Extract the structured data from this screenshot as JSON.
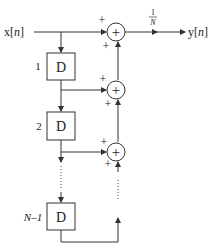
{
  "diagram": {
    "type": "block-diagram",
    "input": {
      "label": "x",
      "index": "n"
    },
    "output": {
      "label": "y",
      "index": "n"
    },
    "gain": {
      "numerator": "1",
      "denominator": "N"
    },
    "delays": [
      {
        "index_label": "1",
        "text": "D"
      },
      {
        "index_label": "2",
        "text": "D"
      },
      {
        "index_label": "N–1",
        "text": "D"
      }
    ],
    "adders": [
      {
        "symbol": "+",
        "sign_left": "+",
        "sign_bottom": "+"
      },
      {
        "symbol": "+",
        "sign_left": "+",
        "sign_bottom": "+"
      },
      {
        "symbol": "+",
        "sign_left": "+",
        "sign_bottom": "+"
      }
    ],
    "ellipsis": "⋮",
    "colors": {
      "stroke": "#333333",
      "background": "#ffffff"
    }
  }
}
